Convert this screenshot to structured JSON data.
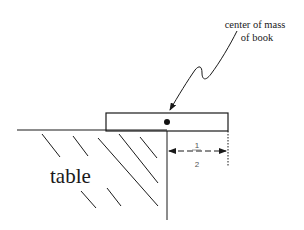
{
  "diagram": {
    "labels": {
      "center_of_mass_line1": "center of mass",
      "center_of_mass_line2": "of book",
      "table": "table",
      "fraction_numerator": "1",
      "fraction_denominator": "2"
    },
    "elements": {
      "table_surface": {
        "x1": 17,
        "y1": 130,
        "x2": 167,
        "y2": 130
      },
      "table_edge": {
        "x1": 167,
        "y1": 130,
        "x2": 167,
        "y2": 220
      },
      "book": {
        "x": 106,
        "y": 113,
        "width": 122,
        "height": 18
      },
      "center_of_mass_dot": {
        "cx": 167,
        "cy": 122,
        "r": 3
      },
      "dimension_arrow": {
        "x1": 169,
        "x2": 227,
        "y": 151
      },
      "book_end_marker": {
        "x": 228,
        "y1": 131,
        "y2": 166
      }
    },
    "colors": {
      "stroke": "#1a1a1a",
      "text": "#1a1a1a",
      "fraction": "#666666"
    }
  }
}
